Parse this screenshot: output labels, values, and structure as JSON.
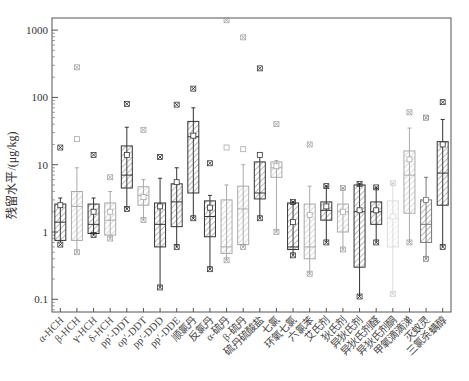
{
  "chart_data": {
    "type": "box",
    "title": "",
    "xlabel": "",
    "ylabel": "残留水平/(μg/kg)",
    "yscale": "log",
    "ylim": [
      0.05,
      1500
    ],
    "yticks": [
      0.1,
      1,
      10,
      100,
      1000
    ],
    "ytick_labels": [
      "0.1",
      "1",
      "10",
      "100",
      "1000"
    ],
    "grid": false,
    "legend": null,
    "categories": [
      "α-HCH",
      "β-HCH",
      "γ-HCH",
      "δ-HCH",
      "pp′-DDT",
      "op′-DDT",
      "pp′-DDD",
      "pp′-DDE",
      "顺氯丹",
      "反氯丹",
      "α-硫丹",
      "β-硫丹",
      "硫丹硫酸盐",
      "七氯",
      "环氧七氯",
      "六氯苯",
      "艾氏剂",
      "狄氏剂",
      "异狄氏剂",
      "异狄氏剂醛",
      "异狄氏剂酮",
      "甲氧滴滴涕",
      "灭蚁灵",
      "三氯杀螨醇"
    ],
    "series": [
      {
        "name": "α-HCH",
        "whisker_low": 0.7,
        "q1": 0.75,
        "median": 1.4,
        "q3": 2.6,
        "whisker_high": 3.2,
        "mean": 2.5,
        "min_marker": 0.65,
        "max_marker": 18,
        "style": "dark"
      },
      {
        "name": "β-HCH",
        "whisker_low": 0.5,
        "q1": 0.75,
        "median": 2.4,
        "q3": 4.0,
        "whisker_high": 9,
        "mean": 24,
        "min_marker": 0.5,
        "max_marker": 280,
        "style": "light"
      },
      {
        "name": "γ-HCH",
        "whisker_low": 0.9,
        "q1": 0.95,
        "median": 1.3,
        "q3": 2.6,
        "whisker_high": 3.2,
        "mean": 2.0,
        "min_marker": 0.9,
        "max_marker": 14,
        "style": "dark"
      },
      {
        "name": "δ-HCH",
        "whisker_low": 0.8,
        "q1": 0.9,
        "median": 1.5,
        "q3": 2.7,
        "whisker_high": 4.0,
        "mean": 2.0,
        "min_marker": 0.8,
        "max_marker": 6.5,
        "style": "light"
      },
      {
        "name": "pp′-DDT",
        "whisker_low": 2.2,
        "q1": 4.5,
        "median": 7,
        "q3": 19,
        "whisker_high": 36,
        "mean": 14,
        "min_marker": 2.2,
        "max_marker": 80,
        "style": "dark"
      },
      {
        "name": "op′-DDT",
        "whisker_low": 1.5,
        "q1": 2.5,
        "median": 3.5,
        "q3": 4.7,
        "whisker_high": 6,
        "mean": 3.3,
        "min_marker": 1.5,
        "max_marker": 33,
        "style": "light"
      },
      {
        "name": "pp′-DDD",
        "whisker_low": 0.15,
        "q1": 0.6,
        "median": 1.3,
        "q3": 2.7,
        "whisker_high": 6.3,
        "mean": 2.4,
        "min_marker": 0.15,
        "max_marker": 13,
        "style": "dark"
      },
      {
        "name": "pp′-DDE",
        "whisker_low": 0.6,
        "q1": 1.2,
        "median": 2.8,
        "q3": 5.2,
        "whisker_high": 9,
        "mean": 5.5,
        "min_marker": 0.6,
        "max_marker": 78,
        "style": "dark"
      },
      {
        "name": "顺氯丹",
        "whisker_low": 1.6,
        "q1": 3.8,
        "median": 26,
        "q3": 44,
        "whisker_high": 70,
        "mean": 27,
        "min_marker": 1.6,
        "max_marker": 135,
        "style": "dark"
      },
      {
        "name": "反氯丹",
        "whisker_low": 0.28,
        "q1": 0.85,
        "median": 1.7,
        "q3": 2.9,
        "whisker_high": 3.5,
        "mean": 2.3,
        "min_marker": 0.28,
        "max_marker": 10.5,
        "style": "dark"
      },
      {
        "name": "α-硫丹",
        "whisker_low": 0.38,
        "q1": 0.48,
        "median": 0.6,
        "q3": 3.0,
        "whisker_high": 5.0,
        "mean": 18,
        "min_marker": 0.38,
        "max_marker": 1400,
        "style": "light"
      },
      {
        "name": "β-硫丹",
        "whisker_low": 0.6,
        "q1": 0.65,
        "median": 2.2,
        "q3": 4.8,
        "whisker_high": 10,
        "mean": 17,
        "min_marker": 0.6,
        "max_marker": 780,
        "style": "light"
      },
      {
        "name": "硫丹硫酸盐",
        "whisker_low": 1.6,
        "q1": 3.1,
        "median": 3.8,
        "q3": 11,
        "whisker_high": 14,
        "mean": 14,
        "min_marker": 1.6,
        "max_marker": 270,
        "style": "dark"
      },
      {
        "name": "七氯",
        "whisker_low": 1.0,
        "q1": 6.5,
        "median": 9,
        "q3": 11,
        "whisker_high": 11.5,
        "mean": 9.5,
        "min_marker": 1.0,
        "max_marker": 40,
        "style": "light"
      },
      {
        "name": "环氧七氯",
        "whisker_low": 0.45,
        "q1": 0.55,
        "median": 0.6,
        "q3": 2.7,
        "whisker_high": 2.8,
        "mean": 1.4,
        "min_marker": 0.45,
        "max_marker": 2.8,
        "style": "dark"
      },
      {
        "name": "六氯苯",
        "whisker_low": 0.24,
        "q1": 0.4,
        "median": 0.6,
        "q3": 2.6,
        "whisker_high": 4.8,
        "mean": 1.8,
        "min_marker": 0.24,
        "max_marker": 20,
        "style": "light"
      },
      {
        "name": "艾氏剂",
        "whisker_low": 0.7,
        "q1": 1.5,
        "median": 2.1,
        "q3": 2.8,
        "whisker_high": 4.8,
        "mean": 2.4,
        "min_marker": 0.7,
        "max_marker": 4.8,
        "style": "dark"
      },
      {
        "name": "狄氏剂",
        "whisker_low": 0.55,
        "q1": 1.0,
        "median": 2.0,
        "q3": 2.6,
        "whisker_high": 4.5,
        "mean": 2.0,
        "min_marker": 0.55,
        "max_marker": 4.5,
        "style": "light"
      },
      {
        "name": "异狄氏剂",
        "whisker_low": 0.11,
        "q1": 0.3,
        "median": 2.0,
        "q3": 5.0,
        "whisker_high": 5.2,
        "mean": 2.1,
        "min_marker": 0.11,
        "max_marker": 5.2,
        "style": "dark"
      },
      {
        "name": "异狄氏剂醛",
        "whisker_low": 0.7,
        "q1": 1.3,
        "median": 2.0,
        "q3": 2.8,
        "whisker_high": 4.5,
        "mean": 2.1,
        "min_marker": 0.7,
        "max_marker": 4.6,
        "style": "dark"
      },
      {
        "name": "异狄氏剂酮",
        "whisker_low": 0.12,
        "q1": 0.6,
        "median": 1.6,
        "q3": 2.9,
        "whisker_high": 5.3,
        "mean": 1.7,
        "min_marker": 0.12,
        "max_marker": 5.3,
        "style": "faint"
      },
      {
        "name": "甲氧滴滴涕",
        "whisker_low": 0.7,
        "q1": 1.9,
        "median": 7,
        "q3": 16,
        "whisker_high": 35,
        "mean": 12,
        "min_marker": 0.7,
        "max_marker": 60,
        "style": "light"
      },
      {
        "name": "灭蚁灵",
        "whisker_low": 0.4,
        "q1": 0.7,
        "median": 1.3,
        "q3": 3.0,
        "whisker_high": 6.5,
        "mean": 3.0,
        "min_marker": 0.4,
        "max_marker": 50,
        "style": "dark-light"
      },
      {
        "name": "三氯杀螨醇",
        "whisker_low": 0.6,
        "q1": 2.5,
        "median": 7.5,
        "q3": 22,
        "whisker_high": 47,
        "mean": 20,
        "min_marker": 0.6,
        "max_marker": 85,
        "style": "dark"
      }
    ]
  },
  "labels": {
    "ylabel": "残留水平/(μg/kg)"
  }
}
